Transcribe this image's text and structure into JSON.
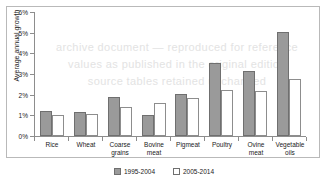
{
  "watermark": {
    "lines": [
      "archive document  —  reproduced for reference",
      "values as published in the original edition",
      "source tables retained unchanged"
    ]
  },
  "legend": {
    "position": "bottom-center",
    "items": [
      {
        "label": "1995-2004",
        "swatch": "filled-grey-swatch"
      },
      {
        "label": "2005-2014",
        "swatch": "outlined-white-swatch"
      }
    ]
  },
  "chart_data": {
    "type": "bar",
    "title": "",
    "xlabel": "",
    "ylabel": "Average annual growth",
    "ylim": [
      0,
      6
    ],
    "ytick_labels": [
      "0%",
      "1%",
      "2%",
      "3%",
      "4%",
      "5%",
      "6%"
    ],
    "ytick_values": [
      0,
      1,
      2,
      3,
      4,
      5,
      6
    ],
    "grid": false,
    "legend_position": "bottom-center",
    "categories": [
      "Rice",
      "Wheat",
      "Coarse grains",
      "Bovine meat",
      "Pigmeat",
      "Poultry",
      "Ovine meat",
      "Vegetable oils"
    ],
    "series": [
      {
        "name": "1995-2004",
        "color": "#9a9a9a",
        "values": [
          1.2,
          1.15,
          1.9,
          1.0,
          2.05,
          3.55,
          3.15,
          5.05
        ]
      },
      {
        "name": "2005-2014",
        "color": "#ffffff",
        "values": [
          1.0,
          1.05,
          1.4,
          1.6,
          1.85,
          2.25,
          2.2,
          2.75
        ]
      }
    ]
  }
}
